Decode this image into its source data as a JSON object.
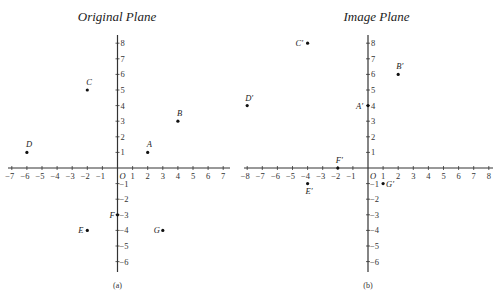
{
  "panels": [
    {
      "id": "a",
      "title": "Original Plane",
      "caption": "(a)",
      "origin_label": "O",
      "origin_px": [
        117.5,
        168
      ],
      "scale_px": [
        15.1,
        15.6
      ],
      "x_range": [
        -7,
        7
      ],
      "y_range": [
        -6,
        8
      ],
      "axis_extent_px": {
        "x": [
          8,
          230
        ],
        "y": [
          35,
          272
        ]
      },
      "points": [
        {
          "label": "A",
          "x": 2,
          "y": 1,
          "lx": -1,
          "ly": -5
        },
        {
          "label": "B",
          "x": 4,
          "y": 3,
          "lx": -1,
          "ly": -5
        },
        {
          "label": "C",
          "x": -2,
          "y": 5,
          "lx": -1,
          "ly": -5
        },
        {
          "label": "D",
          "x": -6,
          "y": 1,
          "lx": -1,
          "ly": -5
        },
        {
          "label": "E",
          "x": -2,
          "y": -4,
          "lx": -9,
          "ly": 3
        },
        {
          "label": "F",
          "x": 0,
          "y": -3,
          "lx": -8,
          "ly": 3
        },
        {
          "label": "G",
          "x": 3,
          "y": -4,
          "lx": -9,
          "ly": 3
        }
      ]
    },
    {
      "id": "b",
      "title": "Image Plane",
      "caption": "(b)",
      "origin_label": "O",
      "origin_px": [
        368,
        168
      ],
      "scale_px": [
        15.1,
        15.6
      ],
      "x_range": [
        -8,
        8
      ],
      "y_range": [
        -6,
        8
      ],
      "axis_extent_px": {
        "x": [
          244,
          493
        ],
        "y": [
          35,
          272
        ]
      },
      "points": [
        {
          "label": "A′",
          "x": 0,
          "y": 4,
          "lx": -12,
          "ly": 3
        },
        {
          "label": "B′",
          "x": 2,
          "y": 6,
          "lx": -2,
          "ly": -5
        },
        {
          "label": "C′",
          "x": -4,
          "y": 8,
          "lx": -12,
          "ly": 3
        },
        {
          "label": "D′",
          "x": -8,
          "y": 4,
          "lx": -2,
          "ly": -5
        },
        {
          "label": "E′",
          "x": -4,
          "y": -1,
          "lx": -2,
          "ly": 10
        },
        {
          "label": "F′",
          "x": -2,
          "y": 0,
          "lx": -2,
          "ly": -5
        },
        {
          "label": "G′",
          "x": 1,
          "y": -1,
          "lx": 3,
          "ly": 3
        }
      ]
    }
  ],
  "chart_data": [
    {
      "type": "scatter",
      "title": "Original Plane",
      "caption": "(a)",
      "xlim": [
        -7,
        7
      ],
      "ylim": [
        -6,
        8
      ],
      "points": [
        {
          "label": "A",
          "x": 2,
          "y": 1
        },
        {
          "label": "B",
          "x": 4,
          "y": 3
        },
        {
          "label": "C",
          "x": -2,
          "y": 5
        },
        {
          "label": "D",
          "x": -6,
          "y": 1
        },
        {
          "label": "E",
          "x": -2,
          "y": -4
        },
        {
          "label": "F",
          "x": 0,
          "y": -3
        },
        {
          "label": "G",
          "x": 3,
          "y": -4
        }
      ]
    },
    {
      "type": "scatter",
      "title": "Image Plane",
      "caption": "(b)",
      "xlim": [
        -8,
        8
      ],
      "ylim": [
        -6,
        8
      ],
      "points": [
        {
          "label": "A′",
          "x": 0,
          "y": 4
        },
        {
          "label": "B′",
          "x": 2,
          "y": 6
        },
        {
          "label": "C′",
          "x": -4,
          "y": 8
        },
        {
          "label": "D′",
          "x": -8,
          "y": 4
        },
        {
          "label": "E′",
          "x": -4,
          "y": -1
        },
        {
          "label": "F′",
          "x": -2,
          "y": 0
        },
        {
          "label": "G′",
          "x": 1,
          "y": -1
        }
      ]
    }
  ]
}
